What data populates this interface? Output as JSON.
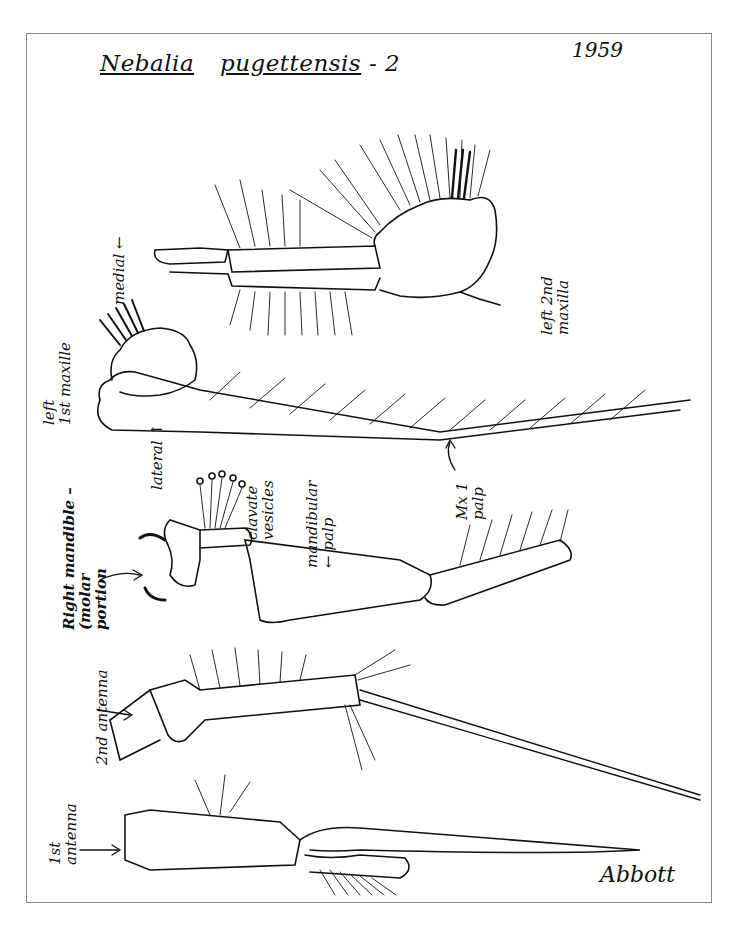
{
  "title": {
    "genus": "Nebalia",
    "species": "pugettensis",
    "plate_suffix": "- 2"
  },
  "year": "1959",
  "signature": "Abbott",
  "labels": {
    "left_2nd_maxilla_line1": "left 2nd",
    "left_2nd_maxilla_line2": "maxilla",
    "left_1st_maxilla_line1": "left",
    "left_1st_maxilla_line2": "1st maxille",
    "medial": "medial ←",
    "lateral": "lateral ↑",
    "mx1_palp_line1": "Mx 1",
    "mx1_palp_line2": "palp",
    "right_mandible_line1": "Right mandible –",
    "right_mandible_line2": "(molar",
    "right_mandible_line3": "portion",
    "clavate_line1": "clavate",
    "clavate_line2": "vesicles",
    "mandibular_palp_line1": "mandibular",
    "mandibular_palp_line2": "← palp",
    "second_antenna": "2nd antenna",
    "first_antenna_line1": "1st",
    "first_antenna_line2": "antenna"
  },
  "colors": {
    "ink": "#111111",
    "paper": "#ffffff",
    "border": "#8a8a8a"
  }
}
